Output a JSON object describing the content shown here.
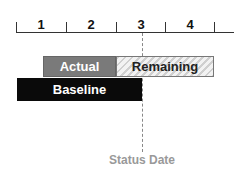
{
  "timeline": {
    "periods": [
      "1",
      "2",
      "3",
      "4"
    ],
    "tick_x": [
      16,
      66,
      116,
      165,
      214
    ]
  },
  "bars": {
    "actual": {
      "label": "Actual",
      "color": "#7a7a7a"
    },
    "remaining": {
      "label": "Remaining",
      "pattern": "hatched-light-gray"
    },
    "baseline": {
      "label": "Baseline",
      "color": "#0a0a0a"
    }
  },
  "status_date": {
    "label": "Status Date",
    "color": "#999999"
  }
}
